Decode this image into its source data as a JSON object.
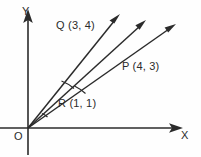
{
  "diagram": {
    "axes": {
      "x_label": "X",
      "y_label": "Y",
      "origin_label": "O"
    },
    "points": [
      {
        "name": "Q",
        "label": "Q (3, 4)",
        "x": 3,
        "y": 4
      },
      {
        "name": "P",
        "label": "P (4, 3)",
        "x": 4,
        "y": 3
      },
      {
        "name": "R",
        "label": "R (1, 1)",
        "x": 1,
        "y": 1
      }
    ],
    "colors": {
      "ink": "#2b2b2b",
      "background": "#fefefe"
    }
  }
}
